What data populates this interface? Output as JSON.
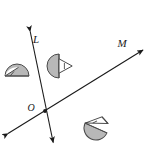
{
  "figure": {
    "type": "geometry-diagram",
    "width": 154,
    "height": 149,
    "background_color": "#ffffff"
  },
  "labels": {
    "line_l": "L",
    "line_m": "M",
    "origin": "O"
  },
  "colors": {
    "stroke": "#1a1a1a",
    "shape_fill": "#b3b3b3",
    "shape_fill_light": "#c9c9c9",
    "shape_stroke": "#4d4d4d",
    "white": "#ffffff"
  },
  "geometry": {
    "point_o": {
      "x": 45,
      "y": 111
    },
    "line_l": {
      "name": "line-l",
      "x1": 29,
      "y1": 26,
      "x2": 54,
      "y2": 147,
      "arrow_start": true,
      "arrow_end": true
    },
    "line_m": {
      "name": "line-m",
      "x1": 3,
      "y1": 137,
      "x2": 148,
      "y2": 47,
      "arrow_start": true,
      "arrow_end": true
    }
  },
  "shapes": [
    {
      "name": "protractor-left",
      "id": "shape-left",
      "center_x": 17,
      "center_y": 76,
      "radius": 12,
      "rotation_deg": 0,
      "note": "half disk, flat side down, with inscribed angle ray from left vertex"
    },
    {
      "name": "protractor-middle",
      "id": "shape-middle",
      "center_x": 59,
      "center_y": 66,
      "radius": 12,
      "rotation_deg": -90,
      "note": "half disk, flat side vertical on left, wedge pointing right"
    },
    {
      "name": "protractor-bottom",
      "id": "shape-bottom",
      "center_x": 96,
      "center_y": 128,
      "radius": 12,
      "rotation_deg": 25,
      "note": "half disk tilted, wedge pointing up-left"
    }
  ],
  "label_positions": {
    "line_l": {
      "x": 36,
      "y": 40
    },
    "line_m": {
      "x": 120,
      "y": 46
    },
    "origin": {
      "x": 30,
      "y": 110
    }
  }
}
